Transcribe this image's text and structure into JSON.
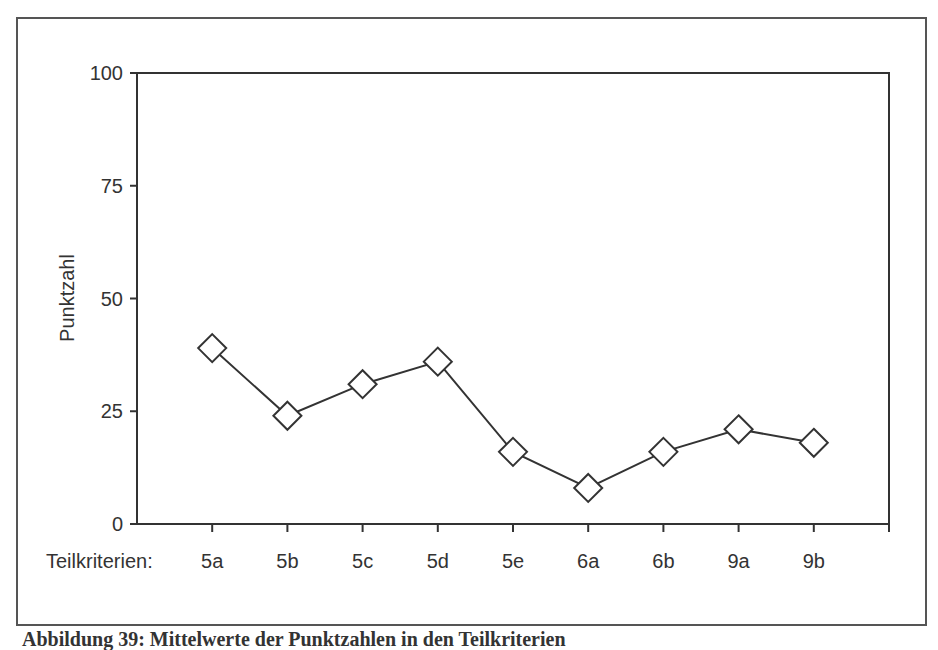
{
  "chart_data": {
    "type": "line",
    "title": "",
    "xlabel": "Teilkriterien:",
    "ylabel": "Punktzahl",
    "ylim": [
      0,
      100
    ],
    "yticks": [
      0,
      25,
      50,
      75,
      100
    ],
    "grid": false,
    "legend": null,
    "marker": "open-diamond",
    "categories": [
      "5a",
      "5b",
      "5c",
      "5d",
      "5e",
      "6a",
      "6b",
      "9a",
      "9b"
    ],
    "values": [
      39,
      24,
      31,
      36,
      16,
      8,
      16,
      21,
      18
    ]
  },
  "caption": "Abbildung 39: Mittelwerte der Punktzahlen in den Teilkriterien"
}
